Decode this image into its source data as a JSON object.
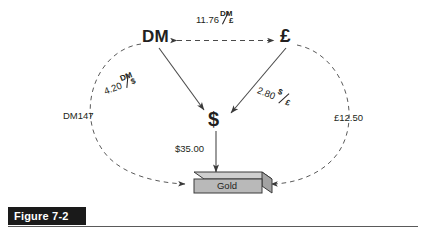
{
  "figure": {
    "caption": "Figure 7-2"
  },
  "diagram": {
    "type": "currency-arbitrage-triangle",
    "nodes": [
      {
        "id": "dm",
        "label": "DM"
      },
      {
        "id": "pound",
        "label": "£"
      },
      {
        "id": "dollar",
        "label": "$"
      },
      {
        "id": "gold",
        "label": "Gold"
      }
    ],
    "rates": {
      "dm_per_pound": {
        "value": "11.76",
        "numerator": "DM",
        "denominator": "£"
      },
      "dm_per_dollar": {
        "value": "4.20",
        "numerator": "DM",
        "denominator": "$"
      },
      "dollar_per_pound": {
        "value": "2.80",
        "numerator": "$",
        "denominator": "£"
      }
    },
    "amounts": {
      "dm_to_gold": "DM147",
      "pound_to_gold": "£12.50",
      "dollar_to_gold": "$35.00"
    },
    "colors": {
      "ink": "#231f20",
      "gold_bar_face": "#b9b9b9",
      "gold_bar_top": "#cfcfcf",
      "gold_bar_side": "#a3a3a3",
      "banner": "#1a1a1a",
      "banner_text": "#ffffff"
    }
  }
}
